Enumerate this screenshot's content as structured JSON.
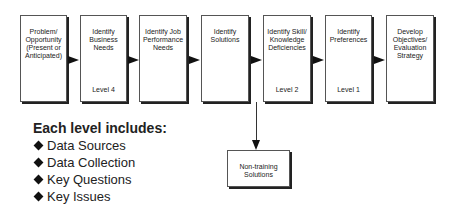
{
  "flow": {
    "steps": [
      {
        "title": "Problem/ Opportunity (Present or Anticipated)",
        "level": ""
      },
      {
        "title": "Identify Business Needs",
        "level": "Level 4"
      },
      {
        "title": "Identify Job Performance Needs",
        "level": ""
      },
      {
        "title": "Identify Solutions",
        "level": ""
      },
      {
        "title": "Identify Skill/ Knowledge Deficiencies",
        "level": "Level 2"
      },
      {
        "title": "Identify Preferences",
        "level": "Level 1"
      },
      {
        "title": "Develop Objectives/ Evaluation Strategy",
        "level": ""
      }
    ],
    "branch": {
      "title": "Non-training Solutions"
    }
  },
  "legend": {
    "heading": "Each level includes:",
    "items": [
      "Data Sources",
      "Data Collection",
      "Key Questions",
      "Key Issues"
    ]
  }
}
